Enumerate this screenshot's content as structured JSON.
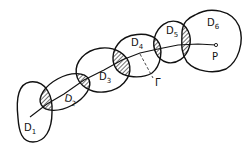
{
  "diagram": {
    "type": "chain-of-domains",
    "regions": [
      {
        "id": "D1",
        "label": "D",
        "subscript": "1"
      },
      {
        "id": "D2",
        "label": "D",
        "subscript": "2"
      },
      {
        "id": "D3",
        "label": "D",
        "subscript": "3"
      },
      {
        "id": "D4",
        "label": "D",
        "subscript": "4"
      },
      {
        "id": "D5",
        "label": "D",
        "subscript": "5"
      },
      {
        "id": "D6",
        "label": "D",
        "subscript": "6"
      }
    ],
    "intersections": [
      "D1∩D2",
      "D2∩D3",
      "D3∩D4",
      "D4∩D5",
      "D5∩D6"
    ],
    "curve_label": "Γ",
    "point_label": "P",
    "stroke_color": "#111111",
    "background": "#ffffff"
  }
}
